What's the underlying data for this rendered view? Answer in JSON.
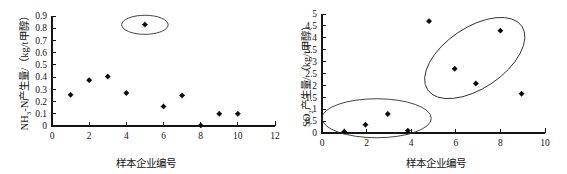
{
  "figure": {
    "background": "#ffffff",
    "marker_color": "#0a0a0a",
    "ellipse_color": "#303030",
    "axis_color": "#141414"
  },
  "chart_data": [
    {
      "id": "nh3n-scatter",
      "type": "scatter",
      "title": "",
      "xlabel": "样本企业编号",
      "ylabel_parts": {
        "lead": "NH",
        "sub": "3",
        "rest": "-N产生量/（kg/t甲醇）"
      },
      "ylabel": "NH3-N产生量/（kg/t甲醇）",
      "xlim": [
        0,
        12
      ],
      "ylim": [
        0,
        0.9
      ],
      "xticks": [
        0,
        2,
        4,
        6,
        8,
        10,
        12
      ],
      "xticklabels": [
        "0",
        "2",
        "4",
        "6",
        "8",
        "10",
        "12"
      ],
      "yticks": [
        0,
        0.1,
        0.2,
        0.3,
        0.4,
        0.5,
        0.6,
        0.7,
        0.8,
        0.9
      ],
      "yticklabels": [
        "0",
        "0.1",
        "0.2",
        "0.3",
        "0.4",
        "0.5",
        "0.6",
        "0.7",
        "0.8",
        "0.9"
      ],
      "grid": false,
      "legend": null,
      "x": [
        1,
        2,
        3,
        4,
        5,
        6,
        7,
        8,
        9,
        10
      ],
      "y": [
        0.255,
        0.375,
        0.405,
        0.27,
        0.83,
        0.16,
        0.25,
        0.005,
        0.1,
        0.1
      ],
      "annotations": [
        {
          "kind": "ellipse",
          "note": "outlier-highlight",
          "cx": 5.0,
          "cy": 0.828,
          "rx": 1.25,
          "ry": 0.078,
          "rotate": 0
        }
      ]
    },
    {
      "id": "so2-scatter",
      "type": "scatter",
      "title": "",
      "xlabel": "样本企业编号",
      "ylabel_parts": {
        "lead": "SO",
        "sub": "2",
        "rest": "产生量/（kg/t甲醇）"
      },
      "ylabel": "SO2产生量/（kg/t甲醇）",
      "xlim": [
        0,
        10
      ],
      "ylim": [
        0,
        5
      ],
      "xticks": [
        0,
        2,
        4,
        6,
        8,
        10
      ],
      "xticklabels": [
        "0",
        "2",
        "4",
        "6",
        "8",
        "10"
      ],
      "yticks": [
        0,
        0.5,
        1,
        1.5,
        2,
        2.5,
        3,
        3.5,
        4,
        4.5,
        5
      ],
      "yticklabels": [
        "0",
        "0.5",
        "1",
        "1.5",
        "2",
        "2.5",
        "3",
        "3.5",
        "4",
        "4.5",
        "5"
      ],
      "grid": false,
      "legend": null,
      "x": [
        1.0,
        1.95,
        2.95,
        3.85,
        4.8,
        5.95,
        6.9,
        8.0,
        8.95
      ],
      "y": [
        0.06,
        0.35,
        0.8,
        0.1,
        4.7,
        2.7,
        2.08,
        4.3,
        1.65
      ],
      "annotations": [
        {
          "kind": "ellipse",
          "note": "low-cluster-highlight",
          "cx": 2.45,
          "cy": 0.62,
          "rx": 2.45,
          "ry": 0.82,
          "rotate": 0
        },
        {
          "kind": "ellipse",
          "note": "high-cluster-highlight",
          "cx": 6.85,
          "cy": 3.15,
          "rx": 2.55,
          "ry": 1.28,
          "rotate": -34
        }
      ]
    }
  ]
}
